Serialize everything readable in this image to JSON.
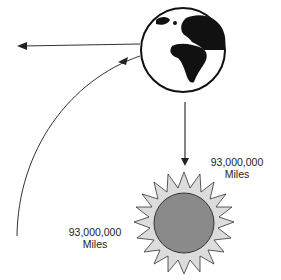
{
  "diagram": {
    "nodes": [
      {
        "id": "earth",
        "icon": "earth-globe-icon",
        "fill": "#ffffff",
        "land": "#111111"
      },
      {
        "id": "sun",
        "icon": "sun-icon",
        "fill": "#8a8a8a",
        "rays": "#dcdcdc"
      }
    ],
    "labels": {
      "right": {
        "distance": "93,000,000",
        "unit": "Miles"
      },
      "left": {
        "distance": "93,000,000",
        "unit": "Miles"
      }
    },
    "arrows": [
      {
        "id": "earth-left",
        "from": "earth",
        "direction": "left"
      },
      {
        "id": "earth-to-sun",
        "from": "earth",
        "to": "sun",
        "direction": "down"
      },
      {
        "id": "orbit-arc",
        "direction": "curved-up-to-earth"
      }
    ],
    "colors": {
      "line": "#222222",
      "sun_core": "#8a8a8a",
      "sun_rays": "#dcdcdc",
      "background": "#ffffff"
    }
  }
}
